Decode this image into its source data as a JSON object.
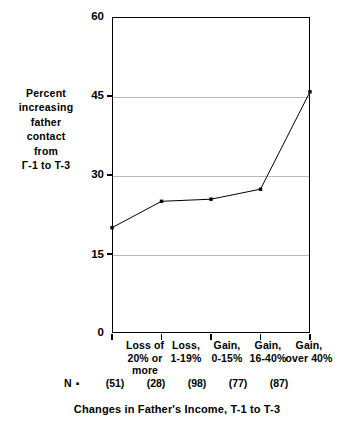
{
  "chart_data": {
    "type": "line",
    "title": "",
    "xlabel": "Changes in Father's Income, T-1 to T-3",
    "ylabel": "Percent increasing father contact from T-1 to T-3",
    "ylabel_lines": [
      "Percent",
      "increasing",
      "father",
      "contact",
      "from",
      "Γ-1 to T-3"
    ],
    "categories": [
      "Loss of 20% or more",
      "Loss, 1-19%",
      "Gain, 0-15%",
      "Gain, 16-40%",
      "Gain, over 40%"
    ],
    "category_lines": [
      [
        "Loss of",
        "20% or",
        "more"
      ],
      [
        "Loss,",
        "1-19%"
      ],
      [
        "Gain,",
        "0-15%"
      ],
      [
        "Gain,",
        "16-40%"
      ],
      [
        "Gain,",
        "over 40%"
      ]
    ],
    "values": [
      20,
      25,
      25.4,
      27.3,
      45.8
    ],
    "n_legend": "N ▪",
    "n_values": [
      "(51)",
      "(28)",
      "(98)",
      "(77)",
      "(87)"
    ],
    "ylim": [
      0,
      60
    ],
    "yticks": [
      0,
      15,
      30,
      45,
      60
    ],
    "ytick_labels": [
      "0",
      "15",
      "30",
      "45",
      "60"
    ],
    "grid": "horizontal",
    "legend": "none",
    "line_color": "#000000",
    "marker_color": "#000000",
    "marker": "square",
    "background_color": "#ffffff",
    "gridline_color": "#b9b9b9"
  }
}
